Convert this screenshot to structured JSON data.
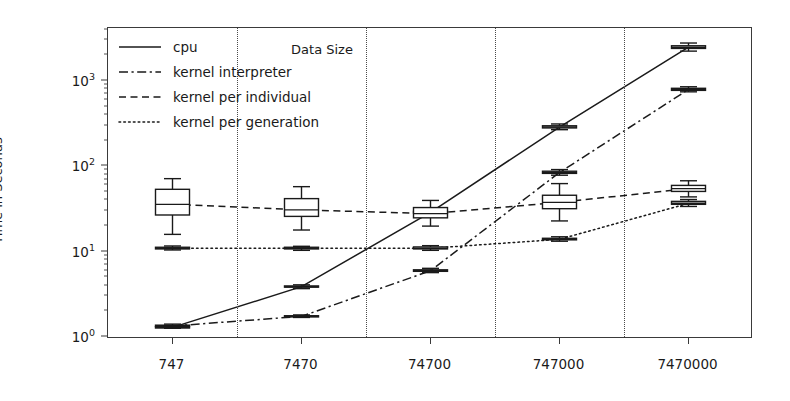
{
  "chart_data": {
    "type": "box",
    "title": "",
    "xlabel": "Data Size",
    "ylabel": "Time in Seconds",
    "yscale": "log",
    "ylim": [
      0.95,
      4200
    ],
    "grid": false,
    "legend_position": "upper left",
    "categories": [
      "747",
      "7470",
      "74700",
      "747000",
      "7470000"
    ],
    "ytick_labels": [
      "10",
      "10",
      "10",
      "10"
    ],
    "ytick_exponents": [
      "0",
      "1",
      "2",
      "3"
    ],
    "ytick_values": [
      1,
      10,
      100,
      1000
    ],
    "series": [
      {
        "name": "cpu",
        "linestyle": "solid",
        "values": [
          1.3,
          3.9,
          29,
          290,
          2500
        ],
        "boxes": [
          {
            "whisker_low": 1.27,
            "q1": 1.29,
            "median": 1.3,
            "q3": 1.32,
            "whisker_high": 1.35
          },
          {
            "whisker_low": 3.7,
            "q1": 3.85,
            "median": 3.9,
            "q3": 3.98,
            "whisker_high": 4.1
          },
          {
            "whisker_low": 27.5,
            "q1": 28.4,
            "median": 29,
            "q3": 29.8,
            "whisker_high": 31
          },
          {
            "whisker_low": 270,
            "q1": 283,
            "median": 290,
            "q3": 300,
            "whisker_high": 315
          },
          {
            "whisker_low": 2250,
            "q1": 2420,
            "median": 2500,
            "q3": 2600,
            "whisker_high": 2800
          }
        ]
      },
      {
        "name": "kernel interpreter",
        "linestyle": "dashdot",
        "values": [
          1.35,
          1.75,
          6.0,
          85,
          800
        ],
        "boxes": [
          {
            "whisker_low": 1.3,
            "q1": 1.33,
            "median": 1.35,
            "q3": 1.38,
            "whisker_high": 1.42
          },
          {
            "whisker_low": 1.7,
            "q1": 1.73,
            "median": 1.75,
            "q3": 1.78,
            "whisker_high": 1.82
          },
          {
            "whisker_low": 5.7,
            "q1": 5.9,
            "median": 6.0,
            "q3": 6.15,
            "whisker_high": 6.4
          },
          {
            "whisker_low": 79,
            "q1": 83,
            "median": 85,
            "q3": 88,
            "whisker_high": 92
          },
          {
            "whisker_low": 750,
            "q1": 780,
            "median": 800,
            "q3": 825,
            "whisker_high": 860
          }
        ]
      },
      {
        "name": "kernel per individual",
        "linestyle": "dashed",
        "values": [
          38,
          32,
          28,
          38,
          55
        ],
        "boxes": [
          {
            "whisker_low": 16,
            "q1": 27,
            "median": 36,
            "q3": 54,
            "whisker_high": 72
          },
          {
            "whisker_low": 18,
            "q1": 26,
            "median": 31,
            "q3": 42,
            "whisker_high": 58
          },
          {
            "whisker_low": 20,
            "q1": 25,
            "median": 28,
            "q3": 33,
            "whisker_high": 40
          },
          {
            "whisker_low": 23,
            "q1": 32,
            "median": 38,
            "q3": 46,
            "whisker_high": 63
          },
          {
            "whisker_low": 44,
            "q1": 51,
            "median": 55,
            "q3": 60,
            "whisker_high": 68
          }
        ]
      },
      {
        "name": "kernel per generation",
        "linestyle": "dotted",
        "values": [
          11,
          11,
          11,
          14,
          37
        ],
        "boxes": [
          {
            "whisker_low": 10.5,
            "q1": 10.8,
            "median": 11,
            "q3": 11.3,
            "whisker_high": 11.7
          },
          {
            "whisker_low": 10.4,
            "q1": 10.8,
            "median": 11,
            "q3": 11.3,
            "whisker_high": 11.6
          },
          {
            "whisker_low": 10.4,
            "q1": 10.8,
            "median": 11,
            "q3": 11.4,
            "whisker_high": 11.8
          },
          {
            "whisker_low": 13.3,
            "q1": 13.8,
            "median": 14,
            "q3": 14.4,
            "whisker_high": 15
          },
          {
            "whisker_low": 34,
            "q1": 36,
            "median": 37,
            "q3": 39,
            "whisker_high": 41
          }
        ]
      }
    ],
    "colors": {
      "line": "#1a1a1a",
      "frame": "#3a3a3a",
      "divider": "#4a4a4a",
      "background": "#ffffff"
    }
  },
  "legend": {
    "entries": [
      {
        "label": "cpu",
        "style": "solid"
      },
      {
        "label": "kernel interpreter",
        "style": "dashdot"
      },
      {
        "label": "kernel per individual",
        "style": "dashed"
      },
      {
        "label": "kernel per generation",
        "style": "dotted"
      }
    ]
  }
}
